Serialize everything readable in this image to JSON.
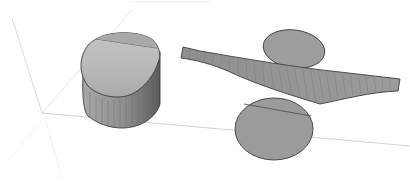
{
  "scene": {
    "description": "3D rendering of geometric surfaces inside a faint bounding box",
    "background": "#ffffff",
    "colors": {
      "face_fill": "#9a9a9a",
      "face_light": "#bdbdbd",
      "face_dark": "#6e6e6e",
      "edge_stroke": "#3c3c3c",
      "mesh_line": "#7c7c7c",
      "axis_line": "#cfcfcf"
    },
    "objects": [
      {
        "name": "cylinder",
        "label": "Cylinder"
      },
      {
        "name": "ribbon-surface",
        "label": "Curved ribbon surface"
      },
      {
        "name": "upper-disc",
        "label": "Upper elliptical disc"
      },
      {
        "name": "lower-disc",
        "label": "Lower elliptical disc"
      }
    ]
  }
}
